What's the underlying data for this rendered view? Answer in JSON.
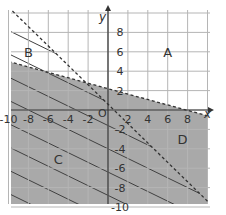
{
  "chart_data": {
    "type": "area",
    "title": "",
    "xlabel": "x",
    "ylabel": "y",
    "xlim": [
      -10,
      10
    ],
    "ylim": [
      -10,
      10
    ],
    "grid": true,
    "x_ticks": [
      -10,
      -8,
      -6,
      -4,
      -2,
      2,
      4,
      6,
      8
    ],
    "y_ticks": [
      8,
      6,
      4,
      2,
      -2,
      -4,
      -6,
      -8,
      -10
    ],
    "origin_label": "O",
    "lines": [
      {
        "name": "steep-boundary",
        "style": "dashed",
        "points": [
          [
            -10,
            10.6
          ],
          [
            10,
            -9.4
          ]
        ],
        "slope": -1,
        "intercept": 0.6
      },
      {
        "name": "shallow-boundary",
        "style": "dashed",
        "points": [
          [
            -10,
            5
          ],
          [
            10,
            -0.6
          ]
        ],
        "slope": -0.28,
        "intercept": 2.2
      }
    ],
    "regions": [
      {
        "label": "A",
        "position": [
          6,
          6
        ],
        "shading": "none"
      },
      {
        "label": "B",
        "position": [
          -8,
          6
        ],
        "shading": "hatched"
      },
      {
        "label": "C",
        "position": [
          -5,
          -5
        ],
        "shading": "gray+hatched"
      },
      {
        "label": "D",
        "position": [
          7.5,
          -3
        ],
        "shading": "gray"
      }
    ],
    "colors": {
      "gray_fill": "#a9a9a9",
      "grid": "#b5b5b5",
      "hatch": "#404040",
      "axis": "#333333"
    }
  }
}
